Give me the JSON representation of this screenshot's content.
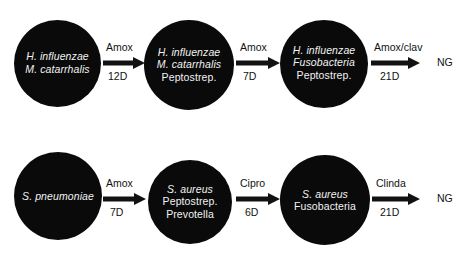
{
  "figure": {
    "type": "flow-diagram",
    "background_color": "#ffffff",
    "node_color": "#0a0a0a",
    "node_text_color": "#ffffff",
    "arrow_color": "#121212",
    "rows": [
      {
        "id": "top-sequence",
        "nodes": [
          {
            "id": "top-node-1",
            "lines": [
              {
                "text": "H. influenzae",
                "italic": true
              },
              {
                "text": "M. catarrhalis",
                "italic": true
              }
            ]
          },
          {
            "id": "top-node-2",
            "lines": [
              {
                "text": "H. influenzae",
                "italic": true
              },
              {
                "text": "M. catarrhalis",
                "italic": true
              },
              {
                "text": "Peptostrep.",
                "italic": false
              }
            ]
          },
          {
            "id": "top-node-3",
            "lines": [
              {
                "text": "H. influenzae",
                "italic": true
              },
              {
                "text": "Fusobacteria",
                "italic": true
              },
              {
                "text": "Peptostrep.",
                "italic": false
              }
            ]
          }
        ],
        "arrows": [
          {
            "id": "top-arrow-1",
            "drug": "Amox",
            "duration": "12D"
          },
          {
            "id": "top-arrow-2",
            "drug": "Amox",
            "duration": "7D"
          },
          {
            "id": "top-arrow-3",
            "drug": "Amox/clav",
            "duration": "21D"
          }
        ],
        "terminal": "NG"
      },
      {
        "id": "bottom-sequence",
        "nodes": [
          {
            "id": "bottom-node-1",
            "lines": [
              {
                "text": "S. pneumoniae",
                "italic": true
              }
            ]
          },
          {
            "id": "bottom-node-2",
            "lines": [
              {
                "text": "S. aureus",
                "italic": true
              },
              {
                "text": "Peptostrep.",
                "italic": false
              },
              {
                "text": "Prevotella",
                "italic": false
              }
            ]
          },
          {
            "id": "bottom-node-3",
            "lines": [
              {
                "text": "S. aureus",
                "italic": true
              },
              {
                "text": "Fusobacteria",
                "italic": false
              }
            ]
          }
        ],
        "arrows": [
          {
            "id": "bottom-arrow-1",
            "drug": "Amox",
            "duration": "7D"
          },
          {
            "id": "bottom-arrow-2",
            "drug": "Cipro",
            "duration": "6D"
          },
          {
            "id": "bottom-arrow-3",
            "drug": "Clinda",
            "duration": "21D"
          }
        ],
        "terminal": "NG"
      }
    ]
  }
}
